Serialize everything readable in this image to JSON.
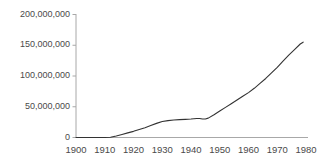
{
  "chart_data": {
    "type": "line",
    "title": "",
    "subtitle": "",
    "xlabel": "",
    "ylabel": "",
    "xlim": [
      1900,
      1980
    ],
    "ylim": [
      0,
      200000000
    ],
    "grid": false,
    "legend": null,
    "legend_position": "none",
    "background_color": "#ffffff",
    "line_color": "#333333",
    "axis_color": "#a8a8a8",
    "text_color": "#4a4a4a",
    "x_tick_labels": [
      "1900",
      "1910",
      "1920",
      "1930",
      "1940",
      "1950",
      "1960",
      "1970",
      "1980"
    ],
    "x_ticks": [
      1900,
      1910,
      1920,
      1930,
      1940,
      1950,
      1960,
      1970,
      1980
    ],
    "y_tick_labels": [
      "0",
      "50,000,000",
      "100,000,000",
      "150,000,000",
      "200,000,000"
    ],
    "y_ticks": [
      0,
      50000000,
      100000000,
      150000000,
      200000000
    ],
    "series": [
      {
        "name": "value",
        "x": [
          1900,
          1905,
          1910,
          1912,
          1914,
          1916,
          1918,
          1920,
          1922,
          1924,
          1926,
          1928,
          1930,
          1932,
          1934,
          1936,
          1938,
          1940,
          1942,
          1943,
          1944,
          1945,
          1946,
          1948,
          1950,
          1952,
          1954,
          1956,
          1958,
          1960,
          1962,
          1964,
          1966,
          1968,
          1970,
          1972,
          1974,
          1976,
          1978,
          1979
        ],
        "values": [
          0,
          0,
          0,
          500000,
          2500000,
          5000000,
          7500000,
          10000000,
          13000000,
          16000000,
          19500000,
          23000000,
          26000000,
          27500000,
          28500000,
          29000000,
          29500000,
          30000000,
          31000000,
          31000000,
          30000000,
          30000000,
          31500000,
          37000000,
          43000000,
          49000000,
          55000000,
          61000000,
          67000000,
          73000000,
          80000000,
          88000000,
          96000000,
          105000000,
          114000000,
          124000000,
          134000000,
          143000000,
          152000000,
          155000000
        ]
      }
    ]
  }
}
